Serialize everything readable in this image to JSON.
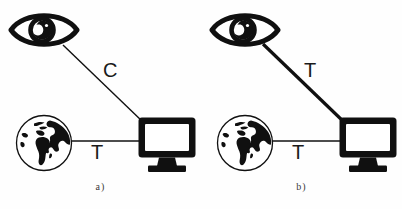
{
  "figure": {
    "background_color": "#fefefe",
    "stroke_color": "#101010",
    "panels": [
      {
        "id": "a",
        "caption": "a)",
        "nodes": {
          "observer": {
            "icon": "eye-icon",
            "label": ""
          },
          "world": {
            "icon": "globe-icon",
            "label": ""
          },
          "display": {
            "icon": "monitor-icon",
            "label": ""
          }
        },
        "links": [
          {
            "id": "observer-display",
            "label": "C",
            "from": "observer",
            "to": "display",
            "style": "thin",
            "stroke_width": 1.4
          },
          {
            "id": "world-display",
            "label": "T",
            "from": "world",
            "to": "display",
            "style": "thin",
            "stroke_width": 1.4
          }
        ]
      },
      {
        "id": "b",
        "caption": "b)",
        "nodes": {
          "observer": {
            "icon": "eye-icon",
            "label": ""
          },
          "world": {
            "icon": "globe-icon",
            "label": ""
          },
          "display": {
            "icon": "monitor-icon",
            "label": ""
          }
        },
        "links": [
          {
            "id": "observer-display",
            "label": "T",
            "from": "observer",
            "to": "display",
            "style": "thick",
            "stroke_width": 3.2
          },
          {
            "id": "world-display",
            "label": "T",
            "from": "world",
            "to": "display",
            "style": "thin",
            "stroke_width": 1.4
          }
        ]
      }
    ]
  }
}
